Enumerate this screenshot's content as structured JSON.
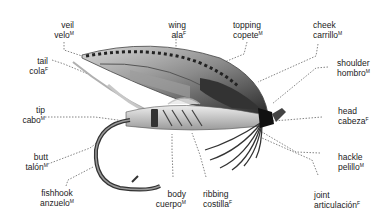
{
  "diagram": {
    "line_style": "dotted",
    "labels": [
      {
        "id": "veil",
        "en": "veil",
        "es": "velo",
        "gender": "M"
      },
      {
        "id": "tail",
        "en": "tail",
        "es": "cola",
        "gender": "F"
      },
      {
        "id": "tip",
        "en": "tip",
        "es": "cabo",
        "gender": "M"
      },
      {
        "id": "butt",
        "en": "butt",
        "es": "talón",
        "gender": "M"
      },
      {
        "id": "fishhook",
        "en": "fishhook",
        "es": "anzuelo",
        "gender": "M"
      },
      {
        "id": "wing",
        "en": "wing",
        "es": "ala",
        "gender": "F"
      },
      {
        "id": "topping",
        "en": "topping",
        "es": "copete",
        "gender": "M"
      },
      {
        "id": "cheek",
        "en": "cheek",
        "es": "carrillo",
        "gender": "M"
      },
      {
        "id": "shoulder",
        "en": "shoulder",
        "es": "hombro",
        "gender": "M"
      },
      {
        "id": "head",
        "en": "head",
        "es": "cabeza",
        "gender": "F"
      },
      {
        "id": "hackle",
        "en": "hackle",
        "es": "pelillo",
        "gender": "M"
      },
      {
        "id": "joint",
        "en": "joint",
        "es": "articulación",
        "gender": "F"
      },
      {
        "id": "ribbing",
        "en": "ribbing",
        "es": "costilla",
        "gender": "F"
      },
      {
        "id": "body",
        "en": "body",
        "es": "cuerpo",
        "gender": "M"
      }
    ]
  }
}
